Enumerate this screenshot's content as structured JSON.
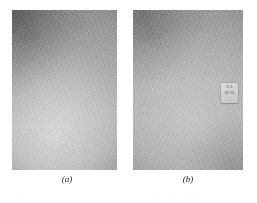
{
  "figure": {
    "panels": [
      {
        "id": "a",
        "caption": "(a)",
        "description": "grayscale photographic micrograph panel, grainy texture, darker upper-left, lighter lower-centre"
      },
      {
        "id": "b",
        "caption": "(b)",
        "description": "grayscale photographic micrograph panel, grainy texture, small white specimen label near right edge"
      }
    ],
    "specimen_label": {
      "line1": "8 5",
      "line2": "IIID 95"
    },
    "bottom_caption_sliver": "the specimen surface before and after treatment, showing comparable grain contrast in both panels",
    "colors": {
      "page_background": "#ffffff",
      "panel_mid_gray": "#a6a6a6",
      "panel_dark_gray": "#8c8c8c",
      "panel_light_gray": "#b4b4b4",
      "caption_text": "#1a1a1a",
      "label_paper": "#d4d4d4"
    }
  }
}
